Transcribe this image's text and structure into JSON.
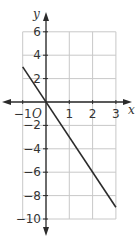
{
  "chart_data": {
    "type": "line",
    "title": "",
    "xlabel": "x",
    "ylabel": "y",
    "origin_label": "O",
    "xlim": [
      -1,
      3
    ],
    "ylim": [
      -10,
      6
    ],
    "grid": true,
    "x_ticks": [
      -1,
      1,
      2,
      3
    ],
    "y_ticks": [
      6,
      4,
      2,
      -2,
      -4,
      -6,
      -8,
      -10
    ],
    "x_tick_labels": [
      "−1",
      "1",
      "2",
      "3"
    ],
    "y_tick_labels": [
      "6",
      "4",
      "2",
      "−2",
      "−4",
      "−6",
      "−8",
      "−10"
    ],
    "series": [
      {
        "name": "y = -3x",
        "x": [
          -1,
          3
        ],
        "y": [
          3,
          -9
        ]
      }
    ],
    "colors": {
      "line": "#2b2b2b",
      "grid": "#c8c8c8",
      "axis": "#2b2b2b"
    }
  }
}
